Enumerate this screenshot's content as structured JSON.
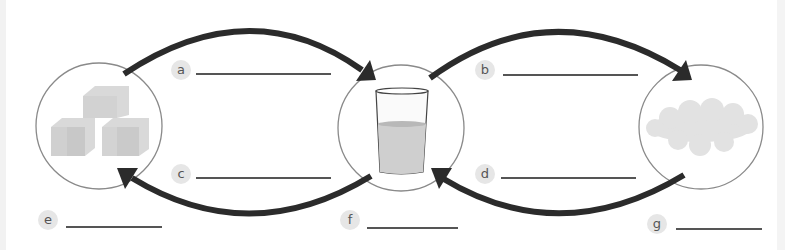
{
  "diagram": {
    "states": [
      {
        "id": "solid",
        "image": "ice-cubes"
      },
      {
        "id": "liquid",
        "image": "glass-of-water"
      },
      {
        "id": "gas",
        "image": "steam-cloud"
      }
    ],
    "arrows": [
      {
        "from": "solid",
        "to": "liquid",
        "label": "a"
      },
      {
        "from": "liquid",
        "to": "gas",
        "label": "b"
      },
      {
        "from": "liquid",
        "to": "solid",
        "label": "c"
      },
      {
        "from": "gas",
        "to": "liquid",
        "label": "d"
      }
    ],
    "state_labels": [
      {
        "for": "solid",
        "label": "e"
      },
      {
        "for": "liquid",
        "label": "f"
      },
      {
        "for": "gas",
        "label": "g"
      }
    ],
    "colors": {
      "arrow": "#2b2b2b",
      "circle": "#8a8a8a",
      "badge": "#e6e6e6",
      "line": "#555555"
    }
  },
  "labels": {
    "a": "a",
    "b": "b",
    "c": "c",
    "d": "d",
    "e": "e",
    "f": "f",
    "g": "g"
  }
}
